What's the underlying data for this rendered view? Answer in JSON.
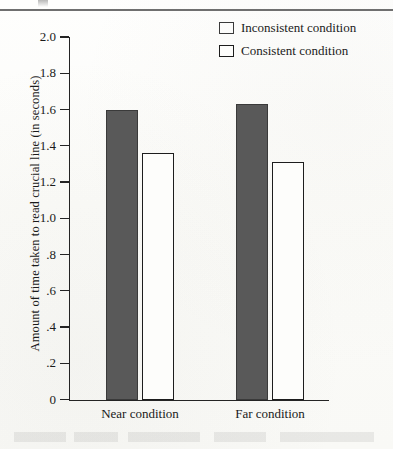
{
  "figure": {
    "top_rule": true,
    "background_color": "#fdfdfb"
  },
  "legend": {
    "position": "top-right",
    "entries": [
      {
        "label": "Inconsistent condition",
        "swatch": "filled",
        "color": "#595959"
      },
      {
        "label": "Consistent condition",
        "swatch": "open",
        "color": "#ffffff"
      }
    ]
  },
  "chart_data": {
    "type": "bar",
    "title": "",
    "xlabel": "",
    "ylabel": "Amount of time taken to read crucial line (in seconds)",
    "categories": [
      "Near condition",
      "Far condition"
    ],
    "series": [
      {
        "name": "Inconsistent condition",
        "values": [
          1.6,
          1.63
        ],
        "color": "#595959"
      },
      {
        "name": "Consistent condition",
        "values": [
          1.36,
          1.31
        ],
        "color": "#ffffff"
      }
    ],
    "ylim": [
      0,
      2.0
    ],
    "ytick_labels": [
      "0",
      ".2",
      ".4",
      ".6",
      ".8",
      "1.0",
      "1.2",
      "1.4",
      "1.6",
      "1.8",
      "2.0"
    ],
    "ytick_values": [
      0,
      0.2,
      0.4,
      0.6,
      0.8,
      1.0,
      1.2,
      1.4,
      1.6,
      1.8,
      2.0
    ],
    "grid": false,
    "legend_position": "top-right"
  }
}
